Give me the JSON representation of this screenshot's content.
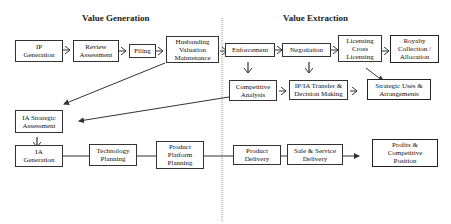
{
  "headers": {
    "left": "Value Generation",
    "right": "Value Extraction"
  },
  "boxes": {
    "ip_generation": "IP\nGeneration",
    "review_assessment": "Review\nAssessment",
    "filing": "Filing",
    "husbanding": "Husbanding\nValuation\nMaintenance",
    "enforcement": "Enforcement",
    "negotiation": "Negotiation",
    "licensing": "Licensing\nCross\nLicensing",
    "royalty": "Royalty\nCollection /\nAllocation",
    "competitive_analysis": "Competitive\nAnalysis",
    "ipia_transfer": "IP/IA Transfer &\nDecision Making",
    "strategic_uses": "Strategic Uses &\nArrangements",
    "ia_strategic": "IA Strategic\nAssessment",
    "ia_generation": "IA\nGeneration",
    "technology_planning": "Technology\nPlanning",
    "product_platform": "Product\nPlatform\nPlanning",
    "product_delivery": "Product\nDelivery",
    "sale_service": "Sale & Service\nDelivery",
    "profits": "Profits &\nCompetitive\nPosition"
  },
  "colors": {
    "line": "#333333",
    "divider": "#777777",
    "background": "#ffffff"
  }
}
